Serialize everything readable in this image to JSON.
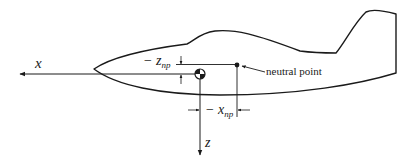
{
  "diagram": {
    "type": "aircraft-axes-neutral-point",
    "labels": {
      "x_axis": "x",
      "z_axis": "z",
      "z_np_prefix": "− z",
      "z_np_sub": "np",
      "x_np_prefix": "− x",
      "x_np_sub": "np",
      "neutral_point": "neutral point"
    },
    "colors": {
      "line": "#1a1a1a",
      "background": "#ffffff"
    }
  }
}
